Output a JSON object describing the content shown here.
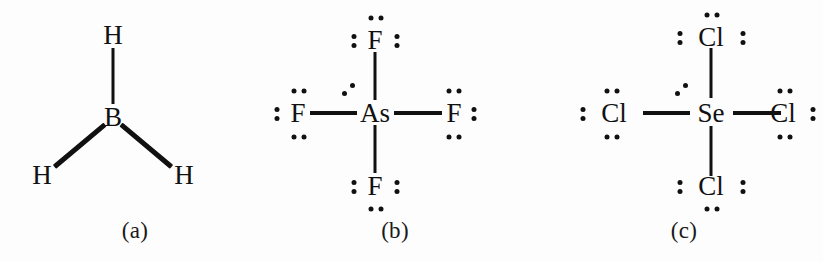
{
  "figure": {
    "kind": "lewis-structure-set",
    "background_color": "#fdfdfd",
    "ink_color": "#111111",
    "panel_count": 3
  },
  "panels": [
    {
      "id": "a",
      "caption": "(a)",
      "molecule": "BH3",
      "geometry": "trigonal planar",
      "center": {
        "symbol": "B",
        "lone_pairs": 0
      },
      "ligands": [
        {
          "symbol": "H",
          "position": "top",
          "bond": "single",
          "lone_pairs": 0
        },
        {
          "symbol": "H",
          "position": "bottom-left",
          "bond": "single",
          "lone_pairs": 0
        },
        {
          "symbol": "H",
          "position": "bottom-right",
          "bond": "single",
          "lone_pairs": 0
        }
      ]
    },
    {
      "id": "b",
      "caption": "(b)",
      "molecule": "AsF4",
      "geometry": "seesaw",
      "center": {
        "symbol": "As",
        "lone_pairs": 1
      },
      "ligands": [
        {
          "symbol": "F",
          "position": "top",
          "bond": "single",
          "lone_pairs": 3,
          "dot_sides": "top,left,right"
        },
        {
          "symbol": "F",
          "position": "left",
          "bond": "single",
          "lone_pairs": 3,
          "dot_sides": "left,top,bottom"
        },
        {
          "symbol": "F",
          "position": "right",
          "bond": "single",
          "lone_pairs": 3,
          "dot_sides": "right,top,bottom"
        },
        {
          "symbol": "F",
          "position": "bottom",
          "bond": "single",
          "lone_pairs": 3,
          "dot_sides": "bottom,left,right"
        }
      ]
    },
    {
      "id": "c",
      "caption": "(c)",
      "molecule": "SeCl4",
      "geometry": "seesaw",
      "center": {
        "symbol": "Se",
        "lone_pairs": 1
      },
      "ligands": [
        {
          "symbol": "Cl",
          "position": "top",
          "bond": "single",
          "lone_pairs": 3,
          "dot_sides": "top,left,right"
        },
        {
          "symbol": "Cl",
          "position": "left",
          "bond": "single",
          "lone_pairs": 3,
          "dot_sides": "left,top,bottom"
        },
        {
          "symbol": "Cl",
          "position": "right",
          "bond": "single",
          "lone_pairs": 3,
          "dot_sides": "right,top,bottom"
        },
        {
          "symbol": "Cl",
          "position": "bottom",
          "bond": "single",
          "lone_pairs": 3,
          "dot_sides": "bottom,left,right"
        }
      ]
    }
  ]
}
